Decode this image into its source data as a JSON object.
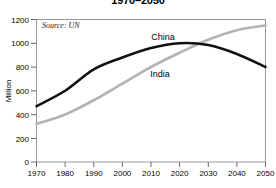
{
  "chart_data": {
    "type": "line",
    "title": "1970–2050",
    "xlabel": "",
    "ylabel": "Million",
    "xlim": [
      1970,
      2050
    ],
    "ylim": [
      0,
      1200
    ],
    "x_ticks": [
      1970,
      1980,
      1990,
      2000,
      2010,
      2020,
      2030,
      2040,
      2050
    ],
    "y_ticks": [
      0,
      200,
      400,
      600,
      800,
      1000,
      1200
    ],
    "grid": false,
    "legend": "inline-labels",
    "annotations": [
      {
        "name": "source-note",
        "text": "Source: UN"
      }
    ],
    "x": [
      1970,
      1980,
      1990,
      2000,
      2010,
      2020,
      2030,
      2040,
      2050
    ],
    "series": [
      {
        "name": "China",
        "color": "#111111",
        "label": "China",
        "values": [
          470,
          600,
          780,
          880,
          960,
          1000,
          985,
          910,
          800
        ]
      },
      {
        "name": "India",
        "color": "#b3b3b3",
        "label": "India",
        "values": [
          320,
          400,
          520,
          660,
          800,
          920,
          1030,
          1110,
          1150
        ]
      }
    ]
  },
  "axis": {
    "y_title": "Million",
    "y_tick_labels": [
      "1200",
      "1000",
      "800",
      "600",
      "400",
      "200",
      "0"
    ],
    "x_tick_labels": [
      "1970",
      "1980",
      "1990",
      "2000",
      "2010",
      "2020",
      "2030",
      "2040",
      "2050"
    ]
  },
  "colors": {
    "china_line": "#111111",
    "india_line": "#b3b3b3",
    "axis": "#888888",
    "text": "#000000",
    "background": "#ffffff"
  }
}
